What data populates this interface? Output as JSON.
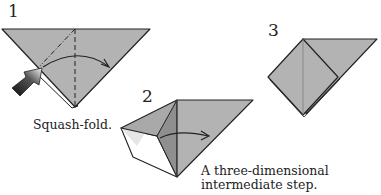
{
  "steps": [
    {
      "number": "1",
      "caption": "Squash-fold."
    },
    {
      "number": "2",
      "caption_line1": "A three-dimensional",
      "caption_line2": "intermediate step."
    },
    {
      "number": "3"
    }
  ],
  "colors": {
    "paper": "#b3b3b3",
    "paper_dark": "#8f8f8f",
    "paper_light": "#d9d9d9",
    "line": "#222222",
    "white": "#ffffff"
  }
}
